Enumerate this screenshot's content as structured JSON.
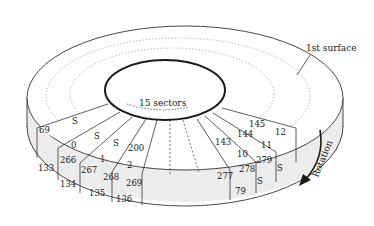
{
  "figure": {
    "labels": {
      "surface": "1st surface",
      "sectors": "15 sectors",
      "rotation": "Rotation"
    },
    "colors": {
      "stroke": "#1a1a1a",
      "shade": "#ececec",
      "dotted": "#777777"
    },
    "sector_labels": {
      "top_left": [
        "S",
        "69",
        "S",
        "0",
        "S",
        "1",
        "200",
        "2"
      ],
      "top_right": [
        "145",
        "12",
        "144",
        "11",
        "143",
        "10",
        "279",
        "S",
        "278",
        "S",
        "277",
        "79"
      ],
      "side_left": [
        "266",
        "133",
        "267",
        "134",
        "268",
        "135",
        "269",
        "136"
      ]
    }
  }
}
